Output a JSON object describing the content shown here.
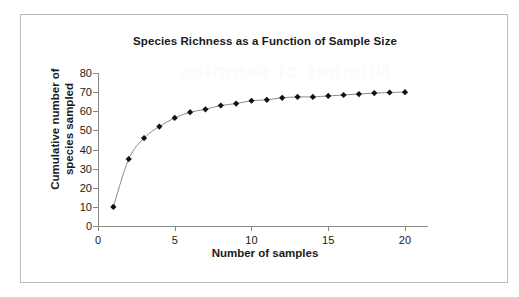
{
  "chart_data": {
    "type": "line",
    "title": "Species Richness as a Function of Sample Size",
    "xlabel": "Number of samples",
    "ylabel": "Cumulative number of species sampled",
    "ylabel_line1": "Cumulative number of",
    "ylabel_line2": "species sampled",
    "x": [
      1,
      2,
      3,
      4,
      5,
      6,
      7,
      8,
      9,
      10,
      11,
      12,
      13,
      14,
      15,
      16,
      17,
      18,
      19,
      20
    ],
    "values": [
      10,
      35,
      46,
      52,
      56.5,
      59.5,
      61,
      63,
      64,
      65.5,
      66,
      67,
      67.5,
      67.5,
      68,
      68.5,
      69,
      69.5,
      69.8,
      70
    ],
    "series": [
      {
        "name": "Cumulative species",
        "values": [
          10,
          35,
          46,
          52,
          56.5,
          59.5,
          61,
          63,
          64,
          65.5,
          66,
          67,
          67.5,
          67.5,
          68,
          68.5,
          69,
          69.5,
          69.8,
          70
        ]
      }
    ],
    "xlim": [
      0,
      21.5
    ],
    "ylim": [
      0,
      80
    ],
    "xticks": [
      0,
      5,
      10,
      15,
      20
    ],
    "xtick_labels": [
      "0",
      "5",
      "10",
      "15",
      "20"
    ],
    "yticks": [
      0,
      10,
      20,
      30,
      40,
      50,
      60,
      70,
      80
    ],
    "ytick_labels": [
      "0",
      "10",
      "20",
      "30",
      "40",
      "50",
      "60",
      "70",
      "80"
    ],
    "grid": false,
    "legend": false,
    "marker": "diamond",
    "marker_color": "#111111",
    "line_color": "#8c8c8c",
    "axis_color": "#8a8a8a",
    "text_color": "#1a1a1a",
    "background": "#ffffff",
    "border_color": "#b9b9b9"
  },
  "artifact": {
    "bleed_text": "Number of samples"
  }
}
